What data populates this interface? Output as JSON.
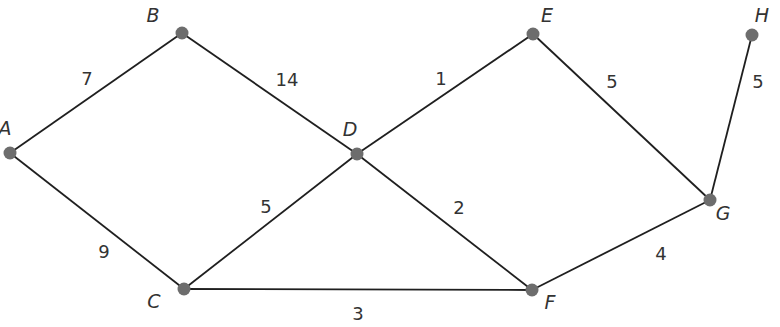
{
  "graph": {
    "nodes": [
      {
        "id": "A",
        "label": "A",
        "x": 10,
        "y": 153,
        "lx": 5,
        "ly": 135
      },
      {
        "id": "B",
        "label": "B",
        "x": 182,
        "y": 33,
        "lx": 153,
        "ly": 22
      },
      {
        "id": "C",
        "label": "C",
        "x": 184,
        "y": 289,
        "lx": 154,
        "ly": 308
      },
      {
        "id": "D",
        "label": "D",
        "x": 357,
        "y": 154,
        "lx": 350,
        "ly": 136
      },
      {
        "id": "E",
        "label": "E",
        "x": 533,
        "y": 34,
        "lx": 547,
        "ly": 22
      },
      {
        "id": "F",
        "label": "F",
        "x": 532,
        "y": 290,
        "lx": 550,
        "ly": 309
      },
      {
        "id": "G",
        "label": "G",
        "x": 710,
        "y": 200,
        "lx": 723,
        "ly": 220
      },
      {
        "id": "H",
        "label": "H",
        "x": 752,
        "y": 35,
        "lx": 762,
        "ly": 22
      }
    ],
    "edges": [
      {
        "from": "A",
        "to": "B",
        "weight": "7",
        "lx": 87,
        "ly": 85
      },
      {
        "from": "B",
        "to": "D",
        "weight": "14",
        "lx": 287,
        "ly": 86
      },
      {
        "from": "A",
        "to": "C",
        "weight": "9",
        "lx": 104,
        "ly": 258
      },
      {
        "from": "C",
        "to": "D",
        "weight": "5",
        "lx": 266,
        "ly": 213
      },
      {
        "from": "D",
        "to": "E",
        "weight": "1",
        "lx": 441,
        "ly": 85
      },
      {
        "from": "D",
        "to": "F",
        "weight": "2",
        "lx": 459,
        "ly": 214
      },
      {
        "from": "C",
        "to": "F",
        "weight": "3",
        "lx": 358,
        "ly": 320
      },
      {
        "from": "E",
        "to": "G",
        "weight": "5",
        "lx": 612,
        "ly": 88
      },
      {
        "from": "F",
        "to": "G",
        "weight": "4",
        "lx": 661,
        "ly": 260
      },
      {
        "from": "G",
        "to": "H",
        "weight": "5",
        "lx": 758,
        "ly": 88
      }
    ]
  },
  "colors": {
    "edge": "#1f1f1f",
    "node": "#6d6d6d",
    "text": "#333333"
  }
}
